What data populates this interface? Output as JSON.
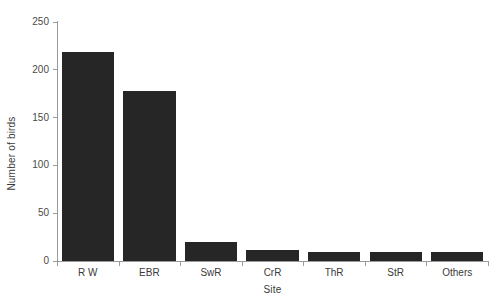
{
  "chart_data": {
    "type": "bar",
    "title": "",
    "xlabel": "Site",
    "ylabel": "Number of birds",
    "categories": [
      "R W",
      "EBR",
      "SwR",
      "CrR",
      "ThR",
      "StR",
      "Others"
    ],
    "values": [
      219,
      178,
      20,
      12,
      9,
      9,
      9
    ],
    "ylim": [
      0,
      250
    ],
    "yticks": [
      0,
      50,
      100,
      150,
      200,
      250
    ],
    "ytick_labels": [
      "0",
      "50",
      "100",
      "150",
      "200",
      "250"
    ],
    "grid": false,
    "legend": null,
    "bar_color": "#262626",
    "axis_color": "#9a9a9a",
    "background_color": "#ffffff"
  }
}
